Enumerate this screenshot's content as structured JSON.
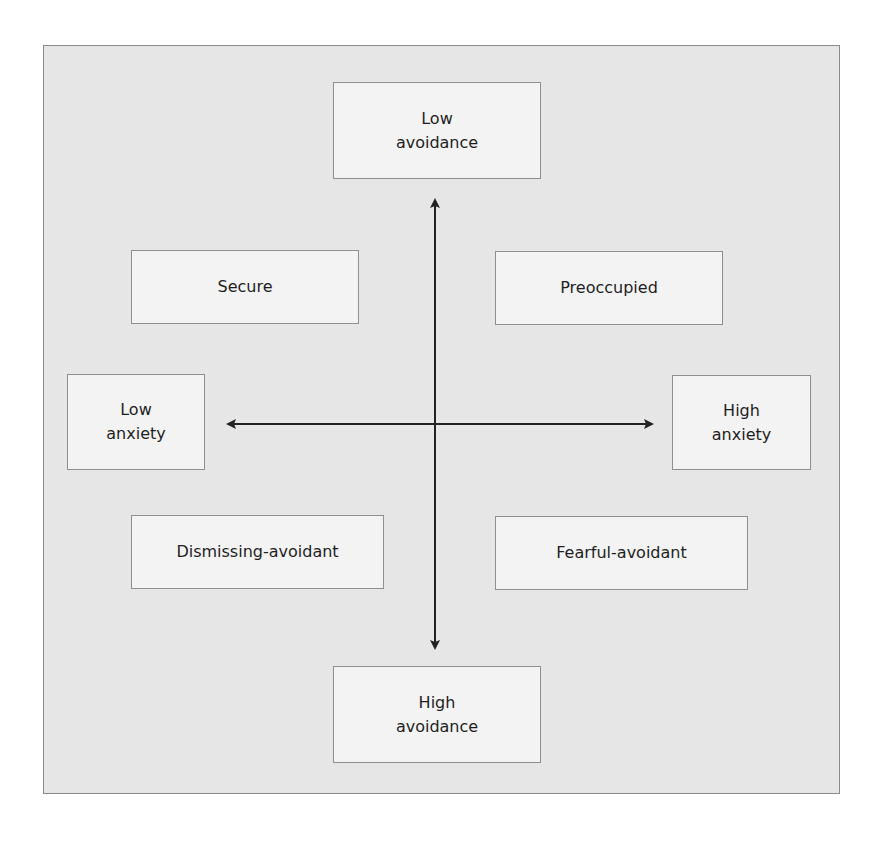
{
  "diagram": {
    "type": "two-dimensional attachment model",
    "axes": {
      "vertical": {
        "top_label": "Low\navoidance",
        "bottom_label": "High\navoidance"
      },
      "horizontal": {
        "left_label": "Low\nanxiety",
        "right_label": "High\nanxiety"
      }
    },
    "quadrants": {
      "top_left": "Secure",
      "top_right": "Preoccupied",
      "bottom_left": "Dismissing-avoidant",
      "bottom_right": "Fearful-avoidant"
    },
    "colors": {
      "panel_background": "#e6e6e6",
      "box_background": "#f3f3f3",
      "box_border": "#8f8f8f",
      "arrow": "#222222",
      "text": "#1e1e1e"
    }
  }
}
